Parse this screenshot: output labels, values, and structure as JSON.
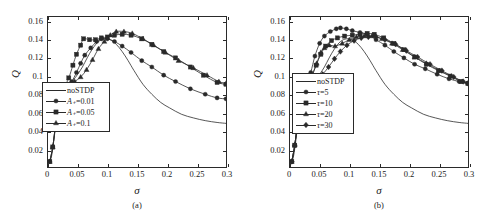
{
  "figure": {
    "panels": [
      {
        "id": "a",
        "caption": "(a)",
        "xlabel": "σ",
        "ylabel": "Q",
        "legend_title": "",
        "legend": [
          {
            "label": "noSTDP",
            "marker": "none"
          },
          {
            "label": "A₊=0.01",
            "marker": "circle"
          },
          {
            "label": "A₊=0.05",
            "marker": "square"
          },
          {
            "label": "A₊=0.1",
            "marker": "triangle"
          }
        ]
      },
      {
        "id": "b",
        "caption": "(b)",
        "xlabel": "σ",
        "ylabel": "Q",
        "legend_title": "",
        "legend": [
          {
            "label": "noSTDP",
            "marker": "none"
          },
          {
            "label": "τ=5",
            "marker": "circle"
          },
          {
            "label": "τ=10",
            "marker": "square"
          },
          {
            "label": "τ=20",
            "marker": "triangle"
          },
          {
            "label": "τ=30",
            "marker": "diamond"
          }
        ]
      }
    ]
  },
  "chart_data": [
    {
      "type": "line",
      "panel": "a",
      "title": "",
      "xlabel": "σ",
      "ylabel": "Q",
      "xlim": [
        0,
        0.3
      ],
      "ylim": [
        0,
        0.165
      ],
      "xticks": [
        0,
        0.05,
        0.1,
        0.15,
        0.2,
        0.25,
        0.3
      ],
      "xticklabels": [
        "0",
        "0.05",
        "0.1",
        "0.15",
        "0.2",
        "0.25",
        "0.3"
      ],
      "yticks": [
        0.02,
        0.04,
        0.06,
        0.08,
        0.1,
        0.12,
        0.14,
        0.16
      ],
      "yticklabels": [
        "0.02",
        "0.04",
        "0.06",
        "0.08",
        "0.1",
        "0.12",
        "0.14",
        "0.16"
      ],
      "grid": false,
      "legend_position": "lower-left-inside",
      "series": [
        {
          "name": "noSTDP",
          "marker": "none",
          "x": [
            0.002,
            0.006,
            0.01,
            0.014,
            0.018,
            0.022,
            0.026,
            0.03,
            0.036,
            0.042,
            0.05,
            0.058,
            0.066,
            0.075,
            0.085,
            0.095,
            0.105,
            0.115,
            0.125,
            0.135,
            0.145,
            0.16,
            0.175,
            0.19,
            0.205,
            0.225,
            0.245,
            0.265,
            0.285,
            0.3
          ],
          "y": [
            0.004,
            0.012,
            0.03,
            0.052,
            0.072,
            0.084,
            0.088,
            0.089,
            0.091,
            0.095,
            0.102,
            0.11,
            0.12,
            0.13,
            0.138,
            0.141,
            0.14,
            0.135,
            0.127,
            0.117,
            0.106,
            0.091,
            0.08,
            0.071,
            0.065,
            0.058,
            0.054,
            0.051,
            0.049,
            0.048
          ]
        },
        {
          "name": "A₊=0.01",
          "marker": "circle",
          "x": [
            0.003,
            0.008,
            0.013,
            0.018,
            0.022,
            0.027,
            0.033,
            0.04,
            0.048,
            0.055,
            0.062,
            0.072,
            0.082,
            0.09,
            0.1,
            0.112,
            0.125,
            0.14,
            0.158,
            0.175,
            0.195,
            0.215,
            0.24,
            0.265,
            0.285,
            0.3
          ],
          "y": [
            0.006,
            0.022,
            0.048,
            0.072,
            0.085,
            0.088,
            0.09,
            0.094,
            0.104,
            0.114,
            0.123,
            0.131,
            0.138,
            0.141,
            0.141,
            0.138,
            0.133,
            0.126,
            0.117,
            0.11,
            0.101,
            0.094,
            0.086,
            0.08,
            0.076,
            0.075
          ]
        },
        {
          "name": "A₊=0.05",
          "marker": "square",
          "x": [
            0.003,
            0.008,
            0.013,
            0.018,
            0.022,
            0.028,
            0.035,
            0.042,
            0.048,
            0.055,
            0.06,
            0.07,
            0.08,
            0.09,
            0.1,
            0.112,
            0.125,
            0.14,
            0.158,
            0.175,
            0.195,
            0.215,
            0.24,
            0.262,
            0.285,
            0.3
          ],
          "y": [
            0.006,
            0.022,
            0.048,
            0.072,
            0.086,
            0.089,
            0.098,
            0.112,
            0.124,
            0.134,
            0.141,
            0.14,
            0.14,
            0.142,
            0.143,
            0.145,
            0.146,
            0.145,
            0.141,
            0.135,
            0.127,
            0.12,
            0.11,
            0.101,
            0.093,
            0.091
          ]
        },
        {
          "name": "A₊=0.1",
          "marker": "triangle",
          "x": [
            0.003,
            0.008,
            0.013,
            0.018,
            0.022,
            0.028,
            0.036,
            0.045,
            0.055,
            0.065,
            0.075,
            0.085,
            0.095,
            0.105,
            0.115,
            0.128,
            0.142,
            0.16,
            0.178,
            0.198,
            0.22,
            0.245,
            0.268,
            0.288,
            0.3
          ],
          "y": [
            0.006,
            0.022,
            0.048,
            0.072,
            0.086,
            0.088,
            0.09,
            0.094,
            0.099,
            0.107,
            0.118,
            0.13,
            0.138,
            0.145,
            0.149,
            0.149,
            0.147,
            0.141,
            0.134,
            0.126,
            0.117,
            0.109,
            0.101,
            0.094,
            0.092
          ]
        }
      ]
    },
    {
      "type": "line",
      "panel": "b",
      "title": "",
      "xlabel": "σ",
      "ylabel": "Q",
      "xlim": [
        0,
        0.3
      ],
      "ylim": [
        0,
        0.165
      ],
      "xticks": [
        0,
        0.05,
        0.1,
        0.15,
        0.2,
        0.25,
        0.3
      ],
      "xticklabels": [
        "0",
        "0.05",
        "0.1",
        "0.15",
        "0.2",
        "0.25",
        "0.3"
      ],
      "yticks": [
        0.02,
        0.04,
        0.06,
        0.08,
        0.1,
        0.12,
        0.14,
        0.16
      ],
      "yticklabels": [
        "0.02",
        "0.04",
        "0.06",
        "0.08",
        "0.1",
        "0.12",
        "0.14",
        "0.16"
      ],
      "grid": false,
      "legend_position": "lower-left-inside",
      "series": [
        {
          "name": "noSTDP",
          "marker": "none",
          "x": [
            0.002,
            0.006,
            0.01,
            0.014,
            0.018,
            0.022,
            0.026,
            0.03,
            0.036,
            0.042,
            0.05,
            0.058,
            0.066,
            0.075,
            0.085,
            0.095,
            0.105,
            0.115,
            0.125,
            0.135,
            0.145,
            0.16,
            0.175,
            0.19,
            0.205,
            0.225,
            0.245,
            0.265,
            0.285,
            0.3
          ],
          "y": [
            0.004,
            0.012,
            0.03,
            0.052,
            0.072,
            0.084,
            0.088,
            0.089,
            0.091,
            0.095,
            0.102,
            0.11,
            0.12,
            0.13,
            0.138,
            0.141,
            0.14,
            0.135,
            0.127,
            0.117,
            0.106,
            0.091,
            0.08,
            0.071,
            0.065,
            0.058,
            0.054,
            0.051,
            0.049,
            0.048
          ]
        },
        {
          "name": "τ=5",
          "marker": "circle",
          "x": [
            0.003,
            0.008,
            0.013,
            0.018,
            0.022,
            0.028,
            0.035,
            0.042,
            0.05,
            0.058,
            0.068,
            0.078,
            0.085,
            0.095,
            0.105,
            0.118,
            0.13,
            0.145,
            0.16,
            0.175,
            0.192,
            0.21,
            0.228,
            0.248,
            0.268,
            0.285,
            0.3
          ],
          "y": [
            0.006,
            0.024,
            0.05,
            0.074,
            0.086,
            0.09,
            0.104,
            0.122,
            0.136,
            0.144,
            0.149,
            0.152,
            0.153,
            0.152,
            0.15,
            0.148,
            0.146,
            0.14,
            0.134,
            0.127,
            0.12,
            0.113,
            0.108,
            0.102,
            0.097,
            0.094,
            0.092
          ]
        },
        {
          "name": "τ=10",
          "marker": "square",
          "x": [
            0.003,
            0.008,
            0.013,
            0.018,
            0.022,
            0.028,
            0.035,
            0.044,
            0.052,
            0.06,
            0.07,
            0.08,
            0.092,
            0.105,
            0.118,
            0.13,
            0.142,
            0.158,
            0.175,
            0.192,
            0.21,
            0.23,
            0.25,
            0.27,
            0.288,
            0.3
          ],
          "y": [
            0.006,
            0.024,
            0.05,
            0.074,
            0.086,
            0.089,
            0.098,
            0.112,
            0.124,
            0.133,
            0.139,
            0.142,
            0.144,
            0.145,
            0.146,
            0.147,
            0.146,
            0.142,
            0.136,
            0.129,
            0.121,
            0.113,
            0.106,
            0.1,
            0.094,
            0.092
          ]
        },
        {
          "name": "τ=20",
          "marker": "triangle",
          "x": [
            0.003,
            0.008,
            0.013,
            0.018,
            0.022,
            0.028,
            0.036,
            0.045,
            0.052,
            0.058,
            0.066,
            0.076,
            0.088,
            0.1,
            0.112,
            0.125,
            0.138,
            0.155,
            0.172,
            0.19,
            0.21,
            0.23,
            0.252,
            0.272,
            0.29,
            0.3
          ],
          "y": [
            0.006,
            0.024,
            0.05,
            0.074,
            0.086,
            0.089,
            0.098,
            0.114,
            0.126,
            0.131,
            0.134,
            0.133,
            0.136,
            0.14,
            0.143,
            0.144,
            0.144,
            0.141,
            0.136,
            0.129,
            0.121,
            0.114,
            0.106,
            0.1,
            0.094,
            0.092
          ]
        },
        {
          "name": "τ=30",
          "marker": "diamond",
          "x": [
            0.003,
            0.008,
            0.013,
            0.018,
            0.022,
            0.028,
            0.036,
            0.045,
            0.055,
            0.065,
            0.075,
            0.085,
            0.096,
            0.108,
            0.12,
            0.132,
            0.145,
            0.16,
            0.178,
            0.196,
            0.215,
            0.236,
            0.256,
            0.276,
            0.292,
            0.3
          ],
          "y": [
            0.006,
            0.024,
            0.05,
            0.074,
            0.086,
            0.089,
            0.092,
            0.096,
            0.102,
            0.11,
            0.119,
            0.127,
            0.134,
            0.139,
            0.142,
            0.143,
            0.143,
            0.14,
            0.135,
            0.128,
            0.121,
            0.113,
            0.106,
            0.099,
            0.094,
            0.092
          ]
        }
      ]
    }
  ]
}
